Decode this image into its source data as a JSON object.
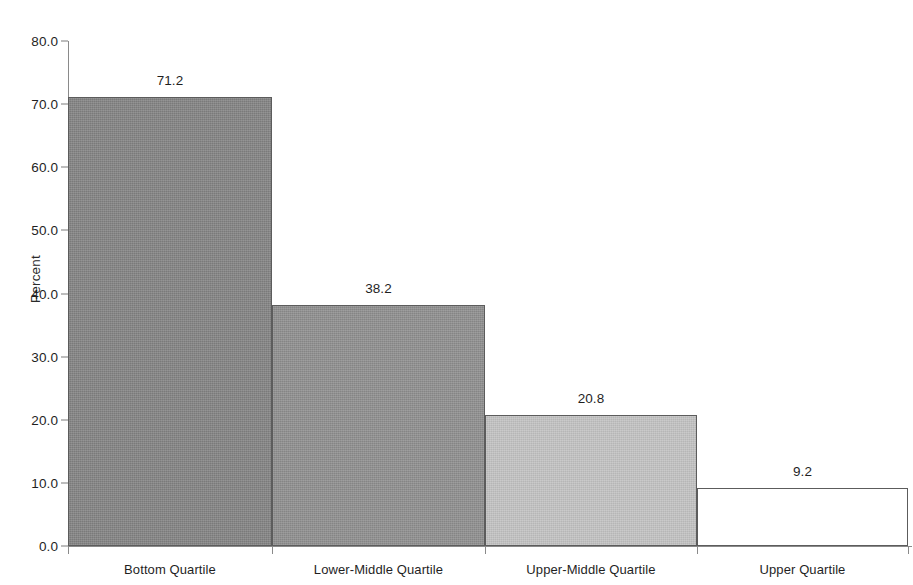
{
  "chart_data": {
    "type": "bar",
    "title": "",
    "xlabel": "",
    "ylabel": "Percent",
    "categories": [
      "Bottom Quartile",
      "Lower-Middle Quartile",
      "Upper-Middle Quartile",
      "Upper Quartile"
    ],
    "values": [
      71.2,
      38.2,
      20.8,
      9.2
    ],
    "value_labels": [
      "71.2",
      "38.2",
      "20.8",
      "9.2"
    ],
    "ylim": [
      0.0,
      80.0
    ],
    "ytick_labels": [
      "0.0",
      "10.0",
      "20.0",
      "30.0",
      "40.0",
      "50.0",
      "60.0",
      "70.0",
      "80.0"
    ],
    "ytick_values": [
      0.0,
      10.0,
      20.0,
      30.0,
      40.0,
      50.0,
      60.0,
      70.0,
      80.0
    ],
    "grid": false,
    "legend": null,
    "bar_colors": [
      "#828282",
      "#8e8e8e",
      "#c2c2c2",
      "#ffffff"
    ],
    "bar_edge_color": "#5c5c5c",
    "axis_color": "#8a8a8a",
    "text_color": "#1f1f1f"
  },
  "geometry": {
    "plot_left": 68,
    "plot_right": 908,
    "baseline_y": 546,
    "top_y": 41,
    "bar_edges": [
      68,
      272,
      485,
      697,
      908
    ]
  }
}
